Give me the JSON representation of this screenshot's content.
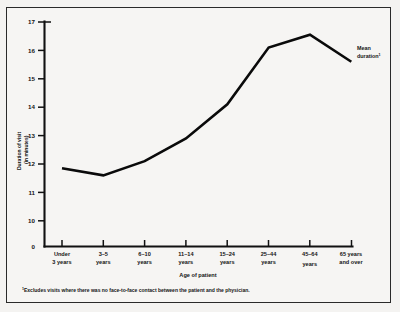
{
  "chart_data": {
    "type": "line",
    "title": "",
    "xlabel": "Age of patient",
    "ylabel": "Duration of visit (in minutes)",
    "categories": [
      "Under 3 years",
      "3–5 years",
      "6–10 years",
      "11–14 years",
      "15–24 years",
      "25–44 years",
      "45–64 years",
      "65 years and over"
    ],
    "series": [
      {
        "name": "Mean duration",
        "values": [
          11.85,
          11.6,
          12.1,
          12.9,
          14.1,
          16.1,
          16.55,
          15.6
        ]
      }
    ],
    "ylim": [
      10,
      17
    ],
    "yticks": [
      10,
      11,
      12,
      13,
      14,
      15,
      16,
      17
    ],
    "ytick_labels": [
      "10",
      "11",
      "12",
      "13",
      "14",
      "15",
      "16",
      "17"
    ],
    "y_axis_break_label": "0",
    "y_axis_has_break": true,
    "grid": false,
    "legend_position": "inline-annotation"
  },
  "axes": {
    "y_title_line1": "Duration of visit",
    "y_title_line2": "(in minutes)",
    "x_title": "Age of patient"
  },
  "xtick_labels": [
    {
      "line1": "Under",
      "line2": "3 years"
    },
    {
      "line1": "3–5",
      "line2": "years"
    },
    {
      "line1": "6–10",
      "line2": "years"
    },
    {
      "line1": "11–14",
      "line2": "years"
    },
    {
      "line1": "15–24",
      "line2": "years"
    },
    {
      "line1": "25–44",
      "line2": "years"
    },
    {
      "line1": "45–64",
      "line2": "years"
    },
    {
      "line1": "65 years",
      "line2": "and over"
    }
  ],
  "ytick_labels": [
    "17",
    "16",
    "15",
    "14",
    "13",
    "12",
    "11",
    "10"
  ],
  "y_zero_label": "0",
  "annotation": {
    "line1": "Mean",
    "line2": "duration",
    "footnote_marker": "1"
  },
  "footnote": {
    "marker": "1",
    "text": "Excludes visits where there was no face-to-face contact between the patient and the physician."
  },
  "colors": {
    "line": "#0a0a0a",
    "axis": "#111111",
    "background": "#f6f5f3",
    "frame": "#2a2a2a",
    "text": "#141414"
  }
}
